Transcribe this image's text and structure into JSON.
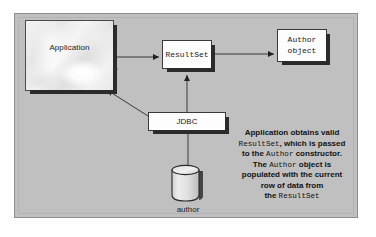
{
  "diagram": {
    "panel_color": "#c0c0c0",
    "nodes": {
      "application": {
        "label": "Application"
      },
      "resultset": {
        "label": "ResultSet"
      },
      "author_object": {
        "label_line1": "Author",
        "label_line2": "object"
      },
      "jdbc": {
        "label": "JDBC"
      },
      "database": {
        "label": "author"
      }
    },
    "caption": {
      "line1_a": "Application obtains valid",
      "line2_code": "ResultSet",
      "line2_b": ", which is passed",
      "line3_a": "to the ",
      "line3_code": "Author",
      "line3_b": " constructor.",
      "line4_a": "The ",
      "line4_code": "Author",
      "line4_b": " object is",
      "line5": "populated with the current",
      "line6": "row of data from",
      "line7_a": "the ",
      "line7_code": "ResultSet"
    }
  }
}
